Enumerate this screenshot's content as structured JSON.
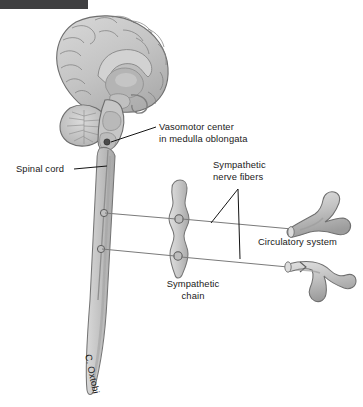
{
  "figure": {
    "background_color": "#ffffff",
    "artist_signature": "C. Oxtobi"
  },
  "top_bar": {
    "name": "page-edge-artifact",
    "color": "#3f3f41"
  },
  "labels": {
    "vasomotor_line1": "Vasomotor center",
    "vasomotor_line2": "in medulla oblongata",
    "spinal_cord": "Spinal cord",
    "nerve_fibers_line1": "Sympathetic",
    "nerve_fibers_line2": "nerve fibers",
    "circulatory_system": "Circulatory system",
    "chain_line1": "Sympathetic",
    "chain_line2": "chain"
  },
  "structures": {
    "brain": "mid-sagittal cerebrum with gyri and corpus callosum",
    "cerebellum": "cerebellum with arbor vitae",
    "brainstem": "brainstem and medulla oblongata",
    "spinal_cord": "spinal cord tapering inferiorly",
    "sympathetic_chain": "beaded paravertebral ganglion chain",
    "vessel_upper": "branching blood vessel, upper",
    "vessel_lower": "branching blood vessel, lower",
    "vasomotor_dot": "vasomotor center marker"
  },
  "colors": {
    "tissue_fill": "#c9c9c9",
    "tissue_light": "#dcdcdc",
    "tissue_mid": "#b6b6b6",
    "tissue_dark": "#9a9a9a",
    "outline": "#6e6e6e",
    "nerve": "#7a7a7a",
    "leader": "#141414",
    "text": "#1a1a1a"
  }
}
